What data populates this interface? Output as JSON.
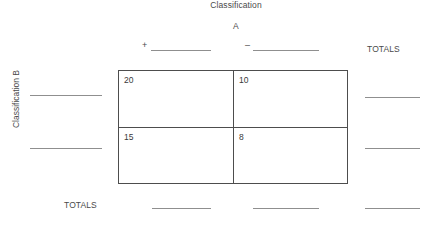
{
  "figure": {
    "type": "contingency-table-worksheet",
    "column_header": {
      "line1": "Classification",
      "line2": "A"
    },
    "row_header": "Classification B",
    "column_categories": [
      {
        "symbol": "+",
        "blank": ""
      },
      {
        "symbol": "–",
        "blank": ""
      }
    ],
    "totals_label_right": "TOTALS",
    "totals_label_bottom": "TOTALS",
    "table": {
      "rows": [
        {
          "label_blank": "",
          "cells": [
            "20",
            "10"
          ],
          "row_total_blank": ""
        },
        {
          "label_blank": "",
          "cells": [
            "15",
            "8"
          ],
          "row_total_blank": ""
        }
      ],
      "column_totals_blank": [
        "",
        ""
      ],
      "grand_total_blank": ""
    },
    "colors": {
      "border": "#4d4d4d",
      "rule": "#8f8f8f",
      "text": "#3a3a3a",
      "background": "#ffffff"
    }
  }
}
